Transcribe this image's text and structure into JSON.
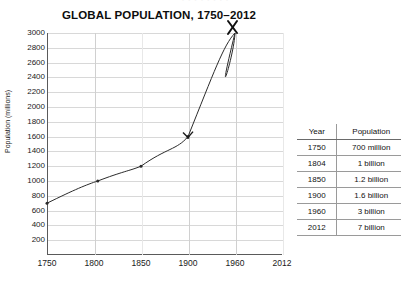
{
  "scan": {
    "top_bleed_text": "· · · · · · · ·"
  },
  "chart_data": {
    "type": "line",
    "title": "GLOBAL POPULATION, 1750–2012",
    "xlabel": "",
    "ylabel": "Population (millions)",
    "grid": true,
    "legend": "none",
    "xlim": [
      1750,
      2012
    ],
    "ylim": [
      0,
      3000
    ],
    "xticks": [
      "1750",
      "1800",
      "1850",
      "1900",
      "1960",
      "2012"
    ],
    "xtick_values": [
      1750,
      1800,
      1850,
      1900,
      1960,
      2012
    ],
    "yticks": [
      "200",
      "400",
      "600",
      "800",
      "1000",
      "1200",
      "1400",
      "1600",
      "1800",
      "2000",
      "2200",
      "2400",
      "2600",
      "2800",
      "3000"
    ],
    "ytick_values": [
      200,
      400,
      600,
      800,
      1000,
      1200,
      1400,
      1600,
      1800,
      2000,
      2200,
      2400,
      2600,
      2800,
      3000
    ],
    "x": [
      1750,
      1804,
      1850,
      1900,
      1960,
      2012
    ],
    "values": [
      700,
      1000,
      1200,
      1600,
      3000,
      7000
    ],
    "series": [
      {
        "name": "World population",
        "x": [
          1750,
          1804,
          1850,
          1900,
          1960,
          2012
        ],
        "values": [
          700,
          1000,
          1200,
          1600,
          3000,
          7000
        ]
      }
    ],
    "annotations": [
      {
        "label": "x-mark-1900",
        "x": 1900,
        "y": 1600
      },
      {
        "label": "arrow-head-1960",
        "x": 1960,
        "y": 3000
      }
    ]
  },
  "table": {
    "headers": [
      "Year",
      "Population"
    ],
    "rows": [
      {
        "year": "1750",
        "population": "700 million"
      },
      {
        "year": "1804",
        "population": "1 billion"
      },
      {
        "year": "1850",
        "population": "1.2 billion"
      },
      {
        "year": "1900",
        "population": "1.6 billion"
      },
      {
        "year": "1960",
        "population": "3 billion"
      },
      {
        "year": "2012",
        "population": "7 billion"
      }
    ]
  },
  "colors": {
    "curve": "#2b2b2b",
    "axis": "#5a5a5a",
    "grid": "#d8d8d8",
    "text": "#111111",
    "background": "#ffffff"
  }
}
